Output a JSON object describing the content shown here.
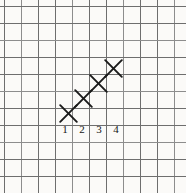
{
  "figure": {
    "width": 186,
    "height": 193,
    "background_color": "#fbfaf8",
    "grid_color": "#6e6e6e",
    "mark_color": "#1a1a1a",
    "label_color": "#151515"
  },
  "grid": {
    "spacing": 17,
    "vertical_lines_x": [
      4,
      21,
      38,
      55,
      72,
      89,
      106,
      123,
      140,
      157,
      174
    ],
    "horizontal_lines_y": [
      6,
      23,
      40,
      57,
      74,
      91,
      108,
      125,
      142,
      159,
      176
    ]
  },
  "marks": [
    {
      "name": "x-mark-1",
      "cx": 68,
      "cy": 113,
      "size": 19
    },
    {
      "name": "x-mark-2",
      "cx": 83,
      "cy": 98,
      "size": 19
    },
    {
      "name": "x-mark-3",
      "cx": 98,
      "cy": 83,
      "size": 19
    },
    {
      "name": "x-mark-4",
      "cx": 113,
      "cy": 68,
      "size": 19
    }
  ],
  "labels": [
    {
      "text": "1",
      "cx": 65,
      "cy": 130
    },
    {
      "text": "2",
      "cx": 82,
      "cy": 130
    },
    {
      "text": "3",
      "cx": 99,
      "cy": 130
    },
    {
      "text": "4",
      "cx": 116,
      "cy": 130
    }
  ],
  "chart_data": {
    "type": "scatter",
    "title": "",
    "xlabel": "",
    "ylabel": "",
    "categories": [
      "1",
      "2",
      "3",
      "4"
    ],
    "x": [
      1,
      2,
      3,
      4
    ],
    "y": [
      1,
      2,
      3,
      4
    ],
    "marker": "x",
    "grid": true,
    "legend": "none",
    "xlim": [
      0,
      11
    ],
    "ylim": [
      0,
      11
    ],
    "tick_labels_x": [
      "1",
      "2",
      "3",
      "4"
    ],
    "tick_labels_y": [],
    "annotations": []
  }
}
